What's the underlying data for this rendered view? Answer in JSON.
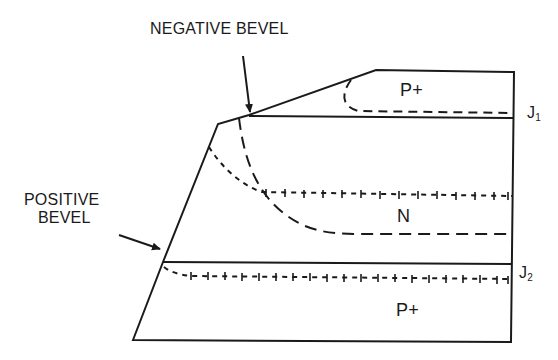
{
  "diagram": {
    "labels": {
      "negative_bevel": "NEGATIVE BEVEL",
      "positive_bevel_line1": "POSITIVE",
      "positive_bevel_line2": "BEVEL"
    },
    "regions": {
      "top": "P+",
      "middle": "N",
      "bottom": "P+"
    },
    "junctions": {
      "j1": {
        "letter": "J",
        "sub": "1"
      },
      "j2": {
        "letter": "J",
        "sub": "2"
      }
    },
    "colors": {
      "line": "#1a1a1a",
      "background": "#ffffff"
    }
  }
}
